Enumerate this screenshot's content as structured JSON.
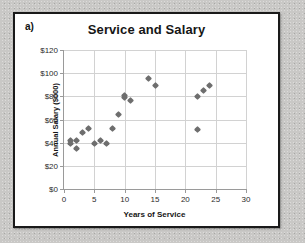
{
  "panel": {
    "letter": "a)"
  },
  "chart_data": {
    "type": "scatter",
    "title": "Service and Salary",
    "xlabel": "Years of Service",
    "ylabel": "Annual Salary ($000)",
    "xlim": [
      0,
      30
    ],
    "ylim": [
      0,
      120
    ],
    "xticks": [
      0,
      5,
      10,
      15,
      20,
      25,
      30
    ],
    "yticks": [
      0,
      20,
      40,
      60,
      80,
      100,
      120
    ],
    "xtick_labels": [
      "0",
      "5",
      "10",
      "15",
      "20",
      "25",
      "30"
    ],
    "ytick_labels": [
      "$0",
      "$20",
      "$40",
      "$60",
      "$80",
      "$100",
      "$120"
    ],
    "grid": "horizontal-and-vertical",
    "legend": "none",
    "marker": "diamond",
    "marker_color": "#6e6e6e",
    "series": [
      {
        "name": "Employees",
        "points": [
          [
            1,
            42
          ],
          [
            1,
            39
          ],
          [
            2,
            42
          ],
          [
            2,
            35
          ],
          [
            3,
            49
          ],
          [
            4,
            52
          ],
          [
            5,
            39
          ],
          [
            6,
            42
          ],
          [
            7,
            39
          ],
          [
            8,
            52
          ],
          [
            9,
            64
          ],
          [
            10,
            81
          ],
          [
            10,
            79
          ],
          [
            11,
            76
          ],
          [
            14,
            95
          ],
          [
            15,
            89
          ],
          [
            22,
            80
          ],
          [
            22,
            51
          ],
          [
            23,
            85
          ],
          [
            24,
            89
          ]
        ]
      }
    ]
  }
}
